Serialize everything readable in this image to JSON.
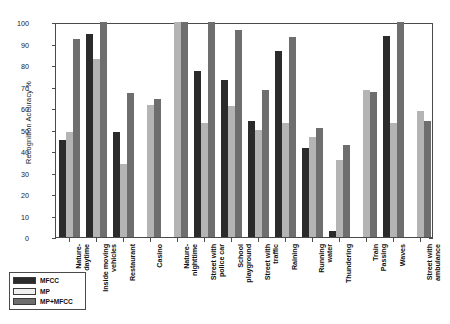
{
  "chart_data": {
    "type": "bar",
    "title": "",
    "xlabel": "",
    "ylabel": "Recognition Accuracy  %",
    "ylim": [
      0,
      100
    ],
    "yticks": [
      0,
      10,
      20,
      30,
      40,
      50,
      60,
      70,
      80,
      90,
      100
    ],
    "grid": false,
    "legend_position": "bottom-left",
    "categories": [
      "Nature-\ndaytime",
      "Inside moving\nvehicles",
      "Restaurant",
      "Casino",
      "Nature-\nnighttime",
      "Street with\npolice car",
      "School\nplayground",
      "Street with\ntraffic",
      "Raining",
      "Running\nwater",
      "Thundering",
      "Train\nPassing",
      "Waves",
      "Street with\nambulance"
    ],
    "series": [
      {
        "name": "MFCC",
        "color": "#2b2b2b",
        "values": [
          45,
          94.5,
          49,
          0,
          0,
          77,
          73,
          54,
          86.5,
          41.5,
          3,
          0,
          93.5,
          0
        ]
      },
      {
        "name": "MP",
        "color": "#b4b4b4",
        "values": [
          49,
          83,
          34,
          61.5,
          100,
          53,
          61,
          50,
          53,
          46.5,
          36,
          68.5,
          53,
          58.5
        ]
      },
      {
        "name": "MP+MFCC",
        "color": "#6e6e6e",
        "values": [
          92,
          100,
          67,
          64,
          100,
          100.5,
          96.5,
          68.5,
          93,
          50.5,
          43,
          67.5,
          101,
          54
        ]
      }
    ]
  },
  "legend": {
    "items": [
      {
        "label": "MFCC",
        "color": "#2b2b2b"
      },
      {
        "label": "MP",
        "color": "#f0f0f0"
      },
      {
        "label": "MP+MFCC",
        "color": "#6e6e6e"
      }
    ]
  }
}
